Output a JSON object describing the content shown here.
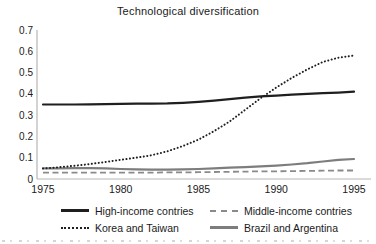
{
  "figure": {
    "title": "Technological diversification"
  },
  "chart_data": {
    "type": "line",
    "title": "Technological diversification",
    "xlabel": "",
    "ylabel": "",
    "xlim": [
      1975,
      1995
    ],
    "ylim": [
      0,
      0.7
    ],
    "grid": false,
    "legend_position": "bottom",
    "background_color": "#ffffff",
    "axis_color": "#b5b5b5",
    "text_color": "#1a1a1a",
    "x": [
      1975,
      1976,
      1977,
      1978,
      1979,
      1980,
      1981,
      1982,
      1983,
      1984,
      1985,
      1986,
      1987,
      1988,
      1989,
      1990,
      1991,
      1992,
      1993,
      1994,
      1995
    ],
    "xticks": [
      1975,
      1980,
      1985,
      1990,
      1995
    ],
    "xtick_labels": [
      "1975",
      "1980",
      "1985",
      "1990",
      "1995"
    ],
    "yticks": [
      0,
      0.1,
      0.2,
      0.3,
      0.4,
      0.5,
      0.6,
      0.7
    ],
    "ytick_labels": [
      "0",
      "0.1",
      "0.2",
      "0.3",
      "0.4",
      "0.5",
      "0.6",
      "0.7"
    ],
    "series": [
      {
        "name": "High-income contries",
        "color": "#1f1f1f",
        "style": "solid",
        "values": [
          0.35,
          0.35,
          0.35,
          0.351,
          0.352,
          0.353,
          0.354,
          0.354,
          0.355,
          0.358,
          0.362,
          0.368,
          0.375,
          0.382,
          0.388,
          0.392,
          0.396,
          0.4,
          0.403,
          0.406,
          0.41
        ]
      },
      {
        "name": "Middle-income contries",
        "color": "#8a8a8a",
        "style": "dashed",
        "values": [
          0.03,
          0.03,
          0.03,
          0.03,
          0.03,
          0.03,
          0.03,
          0.03,
          0.031,
          0.031,
          0.032,
          0.033,
          0.034,
          0.035,
          0.036,
          0.036,
          0.037,
          0.038,
          0.039,
          0.04,
          0.04
        ]
      },
      {
        "name": "Korea and Taiwan",
        "color": "#1f1f1f",
        "style": "dotted",
        "values": [
          0.05,
          0.055,
          0.062,
          0.07,
          0.08,
          0.09,
          0.1,
          0.112,
          0.13,
          0.155,
          0.185,
          0.225,
          0.27,
          0.325,
          0.38,
          0.43,
          0.475,
          0.515,
          0.55,
          0.57,
          0.58
        ]
      },
      {
        "name": "Brazil and Argentina",
        "color": "#7d7d7d",
        "style": "solid",
        "values": [
          0.05,
          0.05,
          0.051,
          0.051,
          0.05,
          0.047,
          0.045,
          0.044,
          0.044,
          0.045,
          0.047,
          0.05,
          0.053,
          0.056,
          0.059,
          0.063,
          0.068,
          0.074,
          0.082,
          0.09,
          0.094
        ]
      }
    ],
    "legend_order": [
      0,
      1,
      2,
      3
    ],
    "draw_order": [
      1,
      3,
      0,
      2
    ]
  }
}
